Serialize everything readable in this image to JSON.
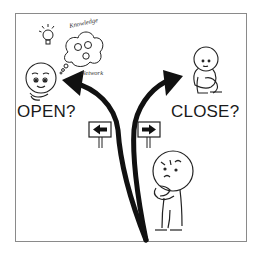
{
  "illustration": {
    "theme": "choice between open and closed",
    "left_option": {
      "label": "OPEN?",
      "thought_bubble": {
        "top_text": "Knowledge",
        "bottom_text": "Network"
      },
      "icons": [
        "lightbulb-icon",
        "thought-bubble-icon",
        "smiling-person-icon"
      ]
    },
    "right_option": {
      "label": "CLOSE?",
      "icons": [
        "sitting-hugging-knees-person-icon"
      ]
    },
    "center": {
      "signs": [
        {
          "direction": "left",
          "icon": "left-arrow-sign-icon"
        },
        {
          "direction": "right",
          "icon": "right-arrow-sign-icon"
        }
      ],
      "character": "thinking-person-icon"
    },
    "colors": {
      "ink": "#1a1a1a",
      "frame": "#8a8a8a",
      "background": "#ffffff"
    }
  }
}
